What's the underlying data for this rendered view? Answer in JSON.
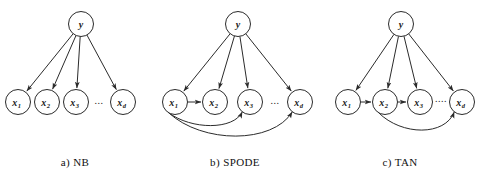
{
  "figure": {
    "background_color": "#ffffff",
    "stroke_color": "#2b2b2b",
    "text_color": "#1a1a1a",
    "width": 490,
    "height": 184
  },
  "panels": [
    {
      "id": "nb",
      "caption": "a) NB",
      "caption_x": 75,
      "caption_y": 166,
      "class_node": {
        "label": "y",
        "cx": 81,
        "cy": 24,
        "r": 12.5
      },
      "attribute_nodes": [
        {
          "base": "x",
          "sub": "1",
          "cx": 18,
          "cy": 102,
          "r": 12.5
        },
        {
          "base": "x",
          "sub": "2",
          "cx": 47,
          "cy": 102,
          "r": 12.5
        },
        {
          "base": "x",
          "sub": "3",
          "cx": 76,
          "cy": 102,
          "r": 12.5
        },
        {
          "base": "x",
          "sub": "d",
          "cx": 123,
          "cy": 102,
          "r": 12.5
        }
      ],
      "ellipsis": {
        "text": "...",
        "cx": 99,
        "cy": 104
      },
      "class_edges": [
        0,
        1,
        2,
        3
      ],
      "attribute_edges": []
    },
    {
      "id": "spode",
      "caption": "b) SPODE",
      "caption_x": 235,
      "caption_y": 166,
      "class_node": {
        "label": "y",
        "cx": 238,
        "cy": 24,
        "r": 12.5
      },
      "attribute_nodes": [
        {
          "base": "x",
          "sub": "1",
          "cx": 175,
          "cy": 102,
          "r": 12.5
        },
        {
          "base": "x",
          "sub": "2",
          "cx": 215,
          "cy": 102,
          "r": 12.5
        },
        {
          "base": "x",
          "sub": "3",
          "cx": 250,
          "cy": 102,
          "r": 12.5
        },
        {
          "base": "x",
          "sub": "d",
          "cx": 300,
          "cy": 102,
          "r": 12.5
        }
      ],
      "ellipsis": {
        "text": "...",
        "cx": 275,
        "cy": 104
      },
      "class_edges": [
        0,
        1,
        2,
        3
      ],
      "attribute_edges": [
        {
          "from": 0,
          "to": 1,
          "style": "straight"
        },
        {
          "from": 0,
          "to": 2,
          "style": "curve",
          "depth": 28
        },
        {
          "from": 0,
          "to": 3,
          "style": "curve",
          "depth": 42
        }
      ]
    },
    {
      "id": "tan",
      "caption": "c) TAN",
      "caption_x": 400,
      "caption_y": 166,
      "class_node": {
        "label": "y",
        "cx": 401,
        "cy": 24,
        "r": 12.5
      },
      "attribute_nodes": [
        {
          "base": "x",
          "sub": "1",
          "cx": 348,
          "cy": 102,
          "r": 12.5
        },
        {
          "base": "x",
          "sub": "2",
          "cx": 385,
          "cy": 102,
          "r": 12.5
        },
        {
          "base": "x",
          "sub": "3",
          "cx": 420,
          "cy": 102,
          "r": 12.5
        },
        {
          "base": "x",
          "sub": "d",
          "cx": 462,
          "cy": 102,
          "r": 12.5
        }
      ],
      "ellipsis": {
        "text": "....",
        "cx": 441,
        "cy": 102
      },
      "class_edges": [
        0,
        1,
        2,
        3
      ],
      "attribute_edges": [
        {
          "from": 0,
          "to": 1,
          "style": "straight"
        },
        {
          "from": 1,
          "to": 2,
          "style": "straight"
        },
        {
          "from": 1,
          "to": 3,
          "style": "curve",
          "depth": 34
        }
      ]
    }
  ]
}
